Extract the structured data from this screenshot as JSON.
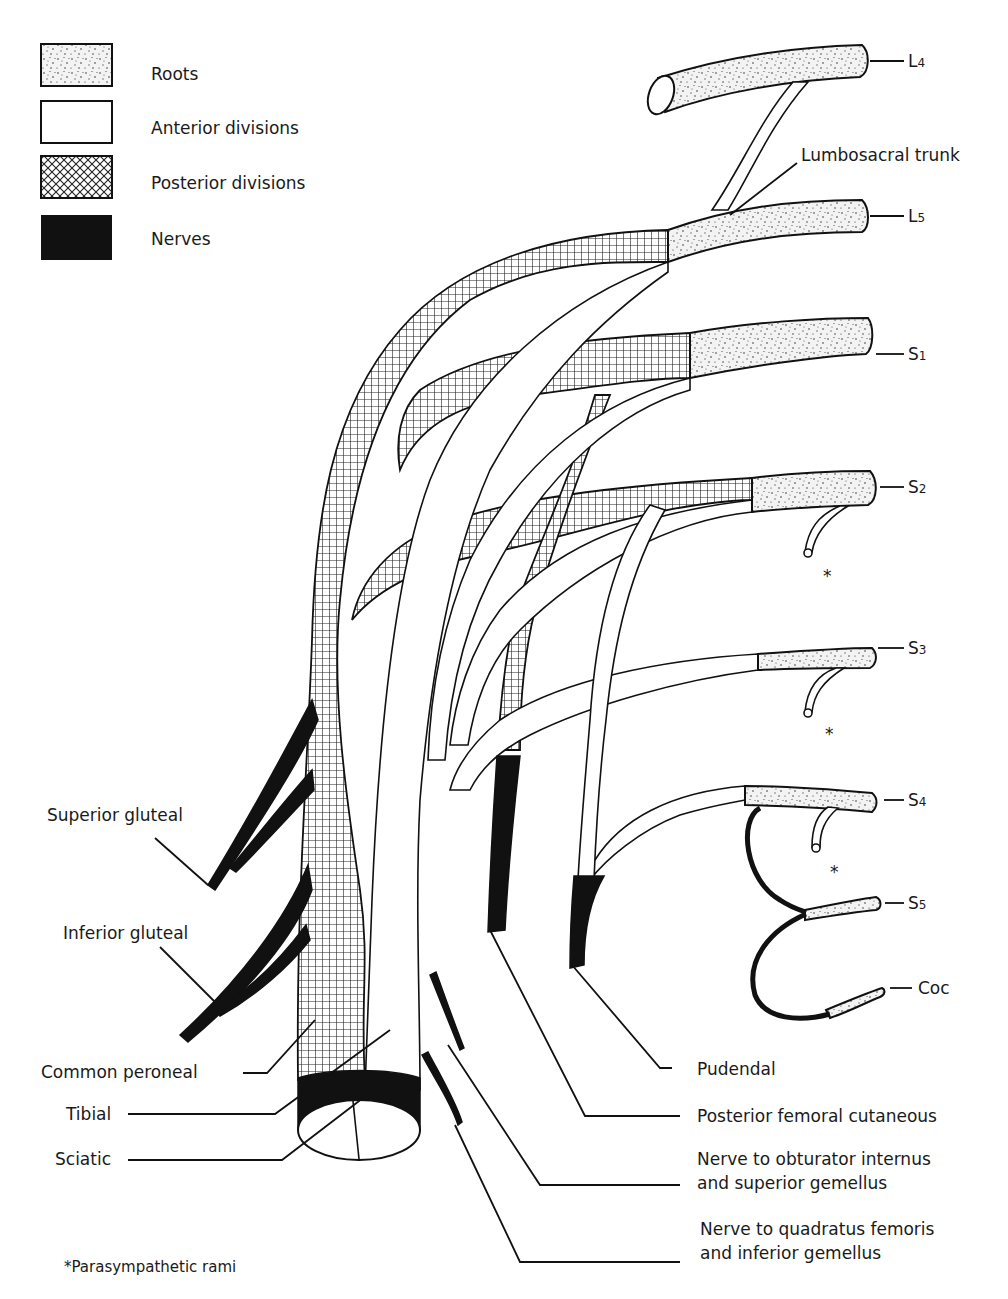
{
  "legend": {
    "items": [
      {
        "pattern": "stipple",
        "label": "Roots"
      },
      {
        "pattern": "white",
        "label": "Anterior divisions"
      },
      {
        "pattern": "crosshatch",
        "label": "Posterior divisions"
      },
      {
        "pattern": "solid-black",
        "label": "Nerves"
      }
    ]
  },
  "roots": {
    "L4": "L4",
    "L5": "L5",
    "S1": "S1",
    "S2": "S2",
    "S3": "S3",
    "S4": "S4",
    "S5": "S5",
    "Coc": "Coc"
  },
  "root_labels": [
    {
      "main": "L",
      "sub": "4"
    },
    {
      "main": "L",
      "sub": "5"
    },
    {
      "main": "S",
      "sub": "1"
    },
    {
      "main": "S",
      "sub": "2"
    },
    {
      "main": "S",
      "sub": "3"
    },
    {
      "main": "S",
      "sub": "4"
    },
    {
      "main": "S",
      "sub": "5"
    },
    {
      "main": "Coc",
      "sub": ""
    }
  ],
  "labels": {
    "lumbosacral_trunk": "Lumbosacral trunk",
    "superior_gluteal": "Superior gluteal",
    "inferior_gluteal": "Inferior gluteal",
    "common_peroneal": "Common peroneal",
    "tibial": "Tibial",
    "sciatic": "Sciatic",
    "pudendal": "Pudendal",
    "posterior_femoral_cutaneous": "Posterior femoral cutaneous",
    "obturator_line1": "Nerve to obturator internus",
    "obturator_line2": "and superior gemellus",
    "quadratus_line1": "Nerve to quadratus femoris",
    "quadratus_line2": "and inferior gemellus"
  },
  "markers": {
    "asterisk": "*"
  },
  "footnote": "*Parasympathetic rami"
}
